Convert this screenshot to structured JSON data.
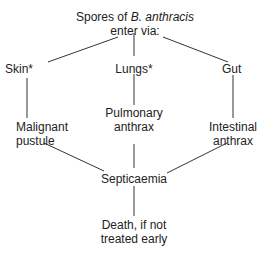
{
  "diagram": {
    "root": {
      "line1_prefix": "Spores of ",
      "line1_italic": "B. anthracis",
      "line2": "enter via:"
    },
    "routes": [
      {
        "entry": "Skin*",
        "disease_line1": "Malignant",
        "disease_line2": "pustule"
      },
      {
        "entry": "Lungs*",
        "disease_line1": "Pulmonary",
        "disease_line2": "anthrax"
      },
      {
        "entry": "Gut",
        "disease_line1": "Intestinal",
        "disease_line2": "anthrax"
      }
    ],
    "convergence": "Septicaemia",
    "outcome": {
      "line1": "Death, if not",
      "line2": "treated early"
    }
  }
}
